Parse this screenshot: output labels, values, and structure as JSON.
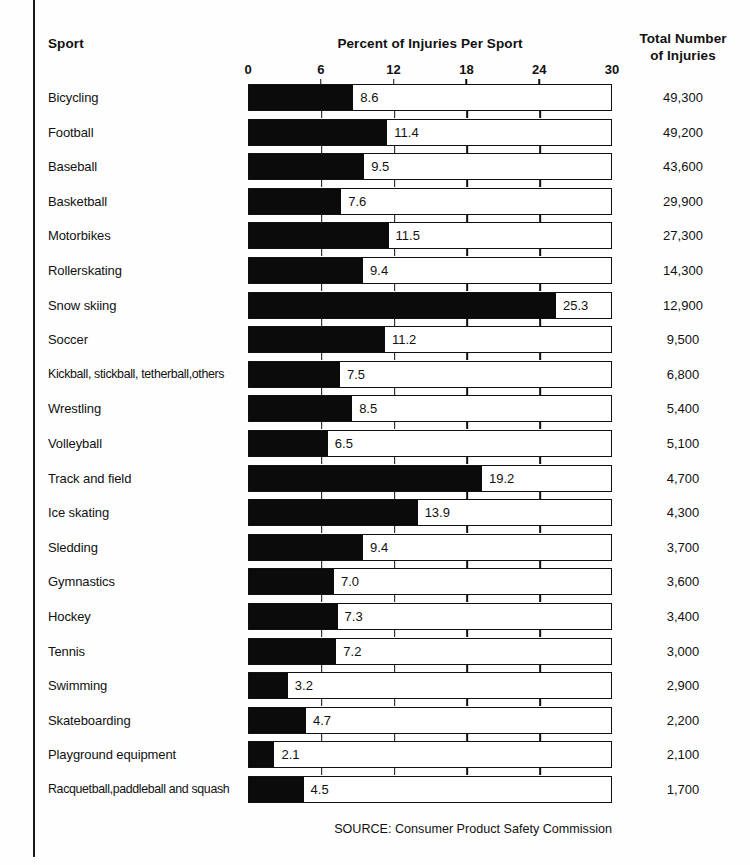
{
  "header": {
    "col_sport": "Sport",
    "col_center": "Percent of Injuries Per Sport",
    "col_total_line1": "Total Number",
    "col_total_line2": "of Injuries"
  },
  "source": "SOURCE: Consumer Product Safety Commission",
  "colors": {
    "bar_fill": "#0b0b0b",
    "bar_outline": "#111111",
    "background": "#fefefe",
    "text": "#111111"
  },
  "chart_data": {
    "type": "bar",
    "orientation": "horizontal",
    "title": "Percent of Injuries Per Sport",
    "xlabel": "",
    "ylabel": "Sport",
    "xlim": [
      0,
      30
    ],
    "xticks": [
      0,
      6,
      12,
      18,
      24,
      30
    ],
    "xtick_labels": [
      "0",
      "6",
      "12",
      "18",
      "24",
      "30"
    ],
    "grid": true,
    "legend": null,
    "categories": [
      "Bicycling",
      "Football",
      "Baseball",
      "Basketball",
      "Motorbikes",
      "Rollerskating",
      "Snow skiing",
      "Soccer",
      "Kickball, stickball, tetherball,others",
      "Wrestling",
      "Volleyball",
      "Track and field",
      "Ice skating",
      "Sledding",
      "Gymnastics",
      "Hockey",
      "Tennis",
      "Swimming",
      "Skateboarding",
      "Playground equipment",
      "Racquetball,paddleball and squash"
    ],
    "values": [
      8.6,
      11.4,
      9.5,
      7.6,
      11.5,
      9.4,
      25.3,
      11.2,
      7.5,
      8.5,
      6.5,
      19.2,
      13.9,
      9.4,
      7.0,
      7.3,
      7.2,
      3.2,
      4.7,
      2.1,
      4.5
    ],
    "value_labels": [
      "8.6",
      "11.4",
      "9.5",
      "7.6",
      "11.5",
      "9.4",
      "25.3",
      "11.2",
      "7.5",
      "8.5",
      "6.5",
      "19.2",
      "13.9",
      "9.4",
      "7.0",
      "7.3",
      "7.2",
      "3.2",
      "4.7",
      "2.1",
      "4.5"
    ],
    "secondary_series": {
      "name": "Total Number of Injuries",
      "values": [
        49300,
        49200,
        43600,
        29900,
        27300,
        14300,
        12900,
        9500,
        6800,
        5400,
        5100,
        4700,
        4300,
        3700,
        3600,
        3400,
        3000,
        2900,
        2200,
        2100,
        1700
      ],
      "labels": [
        "49,300",
        "49,200",
        "43,600",
        "29,900",
        "27,300",
        "14,300",
        "12,900",
        "9,500",
        "6,800",
        "5,400",
        "5,100",
        "4,700",
        "4,300",
        "3,700",
        "3,600",
        "3,400",
        "3,000",
        "2,900",
        "2,200",
        "2,100",
        "1,700"
      ]
    }
  }
}
